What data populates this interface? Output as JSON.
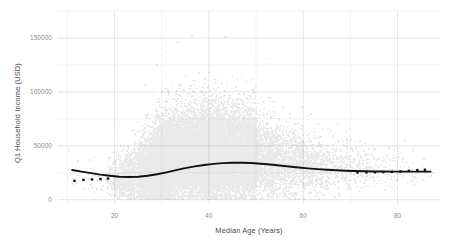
{
  "chart_data": {
    "type": "scatter",
    "title": "",
    "subtitle": "",
    "xlabel": "Median Age (Years)",
    "ylabel": "Q1 Household Income (USD)",
    "xlim": [
      8,
      89
    ],
    "ylim": [
      -4000,
      176000
    ],
    "xticks": [
      20,
      40,
      60,
      80
    ],
    "xtick_labels": [
      "20",
      "40",
      "60",
      "80"
    ],
    "yticks": [
      0,
      50000,
      100000,
      150000
    ],
    "ytick_labels": [
      "0",
      "50000",
      "100000",
      "150000"
    ],
    "x_minor_ticks": [
      10,
      30,
      50,
      70
    ],
    "y_minor_ticks": [
      25000,
      75000,
      125000,
      175000
    ],
    "grid": true,
    "grid_color": "#dddddd",
    "grid_minor_color": "#eeeeee",
    "legend": "none",
    "legend_position": "none",
    "background": "#ffffff",
    "point_color": "#7a7a7a",
    "point_opacity": 0.16,
    "point_size": 1.6,
    "n_points": 30000,
    "trend_color": "#111111",
    "trend_width": 1.9,
    "marker_color": "#111111",
    "marker_size": 2.4,
    "series": [
      {
        "name": "Census tracts",
        "kind": "scatter",
        "description": "Dense semi-transparent gray cloud of census tracts; density peaks near median age 32-48 with Q1 household income 10000-45000; long upper tail to 160000.",
        "density_profile": {
          "x": [
            10,
            14,
            18,
            20,
            22,
            25,
            28,
            30,
            32,
            35,
            38,
            40,
            42,
            45,
            48,
            50,
            55,
            60,
            65,
            70,
            75,
            80,
            85,
            88
          ],
          "count_weight": [
            0.004,
            0.008,
            0.02,
            0.05,
            0.13,
            0.33,
            0.62,
            0.82,
            0.95,
            1.0,
            0.98,
            0.93,
            0.86,
            0.74,
            0.6,
            0.5,
            0.31,
            0.19,
            0.11,
            0.06,
            0.032,
            0.016,
            0.006,
            0.002
          ],
          "median_income": [
            21000,
            20000,
            17500,
            15000,
            16000,
            20000,
            25000,
            28000,
            31000,
            33500,
            34500,
            35000,
            35000,
            34500,
            33500,
            32500,
            30000,
            28500,
            27500,
            26500,
            26000,
            25500,
            25500,
            25500
          ],
          "spread_income": [
            9000,
            9500,
            9500,
            10500,
            12500,
            15500,
            19000,
            21000,
            22500,
            23500,
            24000,
            24000,
            23500,
            23000,
            22000,
            21000,
            18500,
            16500,
            14500,
            12500,
            10500,
            9000,
            8000,
            7500
          ]
        }
      },
      {
        "name": "LOESS trend",
        "kind": "line",
        "x": [
          11,
          13,
          15,
          17,
          19,
          21,
          23,
          25,
          27,
          29,
          31,
          33,
          35,
          37,
          39,
          41,
          43,
          45,
          47,
          49,
          51,
          53,
          55,
          57,
          59,
          61,
          63,
          65,
          67,
          69,
          71,
          73,
          75,
          77,
          79,
          81,
          83,
          85,
          87
        ],
        "y": [
          27500,
          26000,
          24600,
          23300,
          22200,
          21300,
          21000,
          21300,
          22200,
          23600,
          25400,
          27400,
          29300,
          30900,
          32200,
          33200,
          33900,
          34300,
          34300,
          34000,
          33400,
          32600,
          31700,
          30800,
          29900,
          29100,
          28400,
          27800,
          27300,
          26900,
          26600,
          26400,
          26200,
          26100,
          26000,
          26000,
          26000,
          26000,
          26000
        ]
      },
      {
        "name": "Sparse tail markers",
        "kind": "markers",
        "x": [
          11.5,
          13.4,
          15.2,
          17.0,
          18.6,
          71.5,
          73.4,
          75.2,
          77.0,
          78.8,
          80.6,
          82.4,
          84.2,
          85.8
        ],
        "y": [
          17500,
          18400,
          18800,
          19200,
          19600,
          25200,
          25300,
          25400,
          25600,
          25800,
          26200,
          26800,
          27400,
          27800
        ]
      }
    ]
  },
  "axes": {
    "ylabel": "Q1 Household Income (USD)",
    "xlabel": "Median Age (Years)",
    "ytick_0": "0",
    "ytick_1": "50000",
    "ytick_2": "100000",
    "ytick_3": "150000",
    "xtick_0": "20",
    "xtick_1": "40",
    "xtick_2": "60",
    "xtick_3": "80"
  }
}
